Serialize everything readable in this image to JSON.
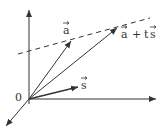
{
  "diagram": {
    "title": "",
    "origin_label": "0",
    "vectors": [
      {
        "name": "a",
        "label": "a",
        "has_arrow_accent": true
      },
      {
        "name": "s",
        "label": "s",
        "has_arrow_accent": true
      },
      {
        "name": "a_plus_ts",
        "label": "a + ts",
        "has_arrow_accent": true
      }
    ],
    "line": {
      "style": "dashed",
      "description": "line through tip of a in direction s"
    },
    "axes": 3,
    "colors": {
      "stroke": "#333333",
      "background": "#ffffff"
    }
  },
  "labels": {
    "origin": "0",
    "a": "a",
    "s": "s",
    "a_plus_ts_a": "a",
    "a_plus_ts_plus": "+",
    "a_plus_ts_t": "t",
    "a_plus_ts_s": "s"
  }
}
